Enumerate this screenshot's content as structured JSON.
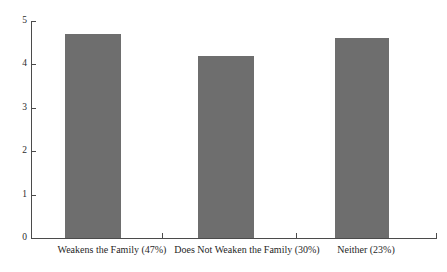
{
  "chart_data": {
    "type": "bar",
    "title": "",
    "subtitle": "",
    "xlabel": "",
    "ylabel": "",
    "ylim": [
      0,
      5
    ],
    "yticks": [
      "0",
      "1",
      "2",
      "3",
      "4",
      "5"
    ],
    "grid": false,
    "legend": "none",
    "bar_color": "#6e6e6e",
    "axis_color": "#4b4b4b",
    "categories": [
      "Weakens the Family (47%)",
      "Does Not Weaken the Family (30%)",
      "Neither (23%)"
    ],
    "values": [
      4.7,
      4.2,
      4.6
    ]
  }
}
